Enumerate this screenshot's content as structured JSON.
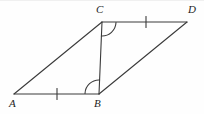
{
  "figure": {
    "canvas": {
      "width": 204,
      "height": 114,
      "background": "#fefefe"
    },
    "stroke_color": "#3a3a3a",
    "label_color": "#1d1d1d",
    "vertices": [
      {
        "name": "A",
        "label": "A",
        "x": 14,
        "y": 94,
        "label_x": 9,
        "label_y": 98
      },
      {
        "name": "B",
        "label": "B",
        "x": 99,
        "y": 94,
        "label_x": 94,
        "label_y": 98
      },
      {
        "name": "C",
        "label": "C",
        "x": 102,
        "y": 22,
        "label_x": 96,
        "label_y": 4
      },
      {
        "name": "D",
        "label": "D",
        "x": 187,
        "y": 22,
        "label_x": 188,
        "label_y": 4
      }
    ],
    "segments": [
      {
        "name": "segment-AB",
        "from": "A",
        "to": "B",
        "x1": 14,
        "y1": 94,
        "x2": 99,
        "y2": 94
      },
      {
        "name": "segment-AC",
        "from": "A",
        "to": "C",
        "x1": 14,
        "y1": 94,
        "x2": 102,
        "y2": 22
      },
      {
        "name": "segment-CD",
        "from": "C",
        "to": "D",
        "x1": 102,
        "y1": 22,
        "x2": 187,
        "y2": 22
      },
      {
        "name": "segment-BD",
        "from": "B",
        "to": "D",
        "x1": 99,
        "y1": 94,
        "x2": 187,
        "y2": 22
      },
      {
        "name": "segment-CB-diagonal",
        "from": "C",
        "to": "B",
        "x1": 102,
        "y1": 22,
        "x2": 99,
        "y2": 94
      }
    ],
    "tick_marks": [
      {
        "name": "tick-on-AB",
        "on_segment": "segment-AB",
        "x": 57,
        "y": 94,
        "orientation": "vertical",
        "count": 1
      },
      {
        "name": "tick-on-CD",
        "on_segment": "segment-CD",
        "x": 146,
        "y": 22,
        "orientation": "vertical",
        "count": 1
      }
    ],
    "angle_arcs": [
      {
        "name": "angle-arc-at-C",
        "vertex": "C",
        "between": "CB and CD",
        "radius": 14
      },
      {
        "name": "angle-arc-at-B",
        "vertex": "B",
        "between": "BA and BC",
        "radius": 14
      }
    ],
    "congruence_notes": {
      "equal_sides": "AB = CD (single tick each)",
      "equal_angles": "angle ABC = angle DCB (single arc each)"
    }
  }
}
